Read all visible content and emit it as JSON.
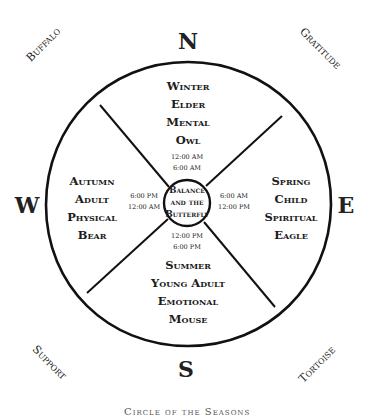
{
  "directions": {
    "north": "N",
    "east": "E",
    "south": "S",
    "west": "W"
  },
  "corners": {
    "northwest": "Buffalo",
    "northeast": "Gratitude",
    "southwest": "Support",
    "southeast": "Tortoise"
  },
  "quadrants": {
    "north": {
      "season": "Winter",
      "stage": "Elder",
      "aspect": "Mental",
      "animal": "Owl"
    },
    "east": {
      "season": "Spring",
      "stage": "Child",
      "aspect": "Spiritual",
      "animal": "Eagle"
    },
    "south": {
      "season": "Summer",
      "stage": "Young Adult",
      "aspect": "Emotional",
      "animal": "Mouse"
    },
    "west": {
      "season": "Autumn",
      "stage": "Adult",
      "aspect": "Physical",
      "animal": "Bear"
    }
  },
  "times": {
    "north": [
      "12:00 AM",
      "6:00 AM"
    ],
    "east": [
      "6:00 AM",
      "12:00 PM"
    ],
    "south": [
      "12:00 PM",
      "6:00 PM"
    ],
    "west": [
      "6:00 PM",
      "12:00 AM"
    ]
  },
  "center": {
    "line1": "Balance",
    "line2": "and the",
    "line3": "Butterfly"
  },
  "caption": "Circle of the Seasons",
  "colors": {
    "stroke": "#111111",
    "background": "#ffffff"
  }
}
